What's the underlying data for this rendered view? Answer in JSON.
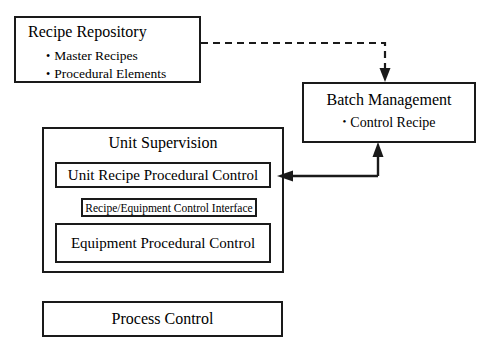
{
  "diagram": {
    "line_color": "#1a1a1a",
    "background_color": "#ffffff"
  },
  "nodes": {
    "recipe_repository": {
      "title": "Recipe Repository",
      "bullets": [
        "Master Recipes",
        "Procedural Elements"
      ]
    },
    "batch_management": {
      "title": "Batch Management",
      "bullet": "Control Recipe"
    },
    "unit_supervision": {
      "title": "Unit Supervision",
      "children": {
        "unit_recipe_procedural_control": "Unit Recipe Procedural Control",
        "recipe_equipment_control_interface": "Recipe/Equipment Control Interface",
        "equipment_procedural_control": "Equipment  Procedural Control"
      }
    },
    "process_control": {
      "title": "Process Control"
    }
  },
  "connectors": [
    {
      "name": "repository-to-batch",
      "style": "dashed",
      "from": "recipe_repository",
      "to": "batch_management",
      "arrowhead": "down"
    },
    {
      "name": "batch-to-unit-supervision",
      "style": "solid",
      "from": "unit_supervision",
      "to": "batch_management",
      "arrowhead": "up"
    },
    {
      "name": "batch-to-unit-recipe-procedural-control",
      "style": "solid",
      "from": "batch_management",
      "to": "unit_recipe_procedural_control",
      "arrowhead": "left"
    }
  ]
}
